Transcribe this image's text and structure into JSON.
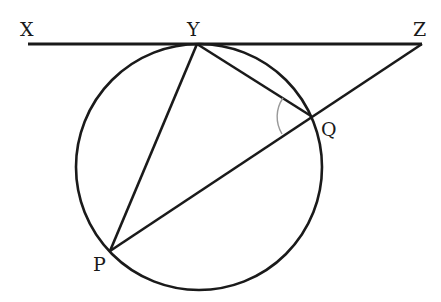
{
  "diagram": {
    "type": "geometry-circle-tangent",
    "labels": {
      "X": "X",
      "Y": "Y",
      "Z": "Z",
      "Q": "Q",
      "P": "P"
    },
    "points": {
      "X": [
        28,
        44
      ],
      "Y": [
        197,
        44
      ],
      "Z": [
        422,
        44
      ],
      "Q": [
        311,
        116
      ],
      "P": [
        110,
        251
      ]
    },
    "circle": {
      "center": [
        199,
        167
      ],
      "radius": 123
    },
    "segments": [
      [
        "X",
        "Z"
      ],
      [
        "Y",
        "P"
      ],
      [
        "Y",
        "Q"
      ],
      [
        "Z",
        "P"
      ]
    ],
    "angle_marker": {
      "at": "Q",
      "between": [
        "Y",
        "P"
      ]
    },
    "colors": {
      "stroke": "#1a1a1a",
      "angle_arc": "#999999",
      "background": "#ffffff"
    }
  }
}
